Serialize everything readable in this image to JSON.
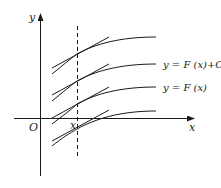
{
  "diagram": {
    "axes": {
      "x_label": "x",
      "y_label": "y",
      "origin_label": "O",
      "x0_label": "x"
    },
    "curves": [
      {
        "name": "top",
        "offset": -64
      },
      {
        "name": "upper-middle",
        "offset": -37
      },
      {
        "name": "lower-middle",
        "offset": -15
      },
      {
        "name": "bottom",
        "offset": 0
      }
    ],
    "labels": {
      "family_curve": "y = F (x)+C",
      "base_curve": "y = F (x)"
    },
    "colors": {
      "stroke": "#1a1a1a",
      "background": "#ffffff"
    }
  }
}
